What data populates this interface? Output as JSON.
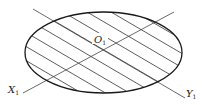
{
  "diagram": {
    "labels": {
      "center": {
        "main": "O",
        "sub": "1"
      },
      "axis_x": {
        "main": "X",
        "sub": "1"
      },
      "axis_y": {
        "main": "Y",
        "sub": "1"
      }
    },
    "colors": {
      "outline": "#1a1a1a",
      "hatch": "#333333",
      "axis": "#555555",
      "background": "#ffffff"
    }
  }
}
